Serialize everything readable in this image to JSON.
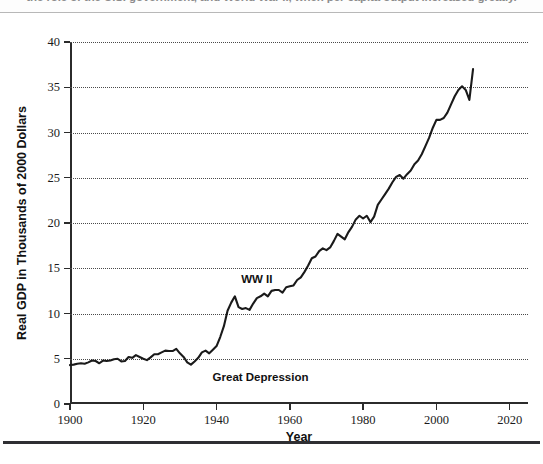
{
  "caption": {
    "text": "the role of the U.S. government, and World War II, when per capita output increased greatly."
  },
  "chart_data": {
    "type": "line",
    "title": "",
    "xlabel": "Year",
    "ylabel": "Real GDP in Thousands of 2000 Dollars",
    "xlim": [
      1900,
      2025
    ],
    "ylim": [
      0,
      40
    ],
    "xticks": [
      1900,
      1920,
      1940,
      1960,
      1980,
      2000,
      2020
    ],
    "yticks": [
      0,
      5,
      10,
      15,
      20,
      25,
      30,
      35,
      40
    ],
    "grid": true,
    "legend": "none",
    "line_color": "#1a1a1a",
    "series": [
      {
        "name": "Real GDP per capita",
        "x": [
          1900,
          1901,
          1902,
          1903,
          1904,
          1905,
          1906,
          1907,
          1908,
          1909,
          1910,
          1911,
          1912,
          1913,
          1914,
          1915,
          1916,
          1917,
          1918,
          1919,
          1920,
          1921,
          1922,
          1923,
          1924,
          1925,
          1926,
          1927,
          1928,
          1929,
          1930,
          1931,
          1932,
          1933,
          1934,
          1935,
          1936,
          1937,
          1938,
          1939,
          1940,
          1941,
          1942,
          1943,
          1944,
          1945,
          1946,
          1947,
          1948,
          1949,
          1950,
          1951,
          1952,
          1953,
          1954,
          1955,
          1956,
          1957,
          1958,
          1959,
          1960,
          1961,
          1962,
          1963,
          1964,
          1965,
          1966,
          1967,
          1968,
          1969,
          1970,
          1971,
          1972,
          1973,
          1974,
          1975,
          1976,
          1977,
          1978,
          1979,
          1980,
          1981,
          1982,
          1983,
          1984,
          1985,
          1986,
          1987,
          1988,
          1989,
          1990,
          1991,
          1992,
          1993,
          1994,
          1995,
          1996,
          1997,
          1998,
          1999,
          2000,
          2001,
          2002,
          2003,
          2004,
          2005,
          2006,
          2007,
          2008,
          2009,
          2010
        ],
        "values": [
          4.3,
          4.35,
          4.45,
          4.5,
          4.45,
          4.6,
          4.8,
          4.75,
          4.5,
          4.8,
          4.75,
          4.8,
          4.95,
          5.0,
          4.7,
          4.75,
          5.2,
          5.1,
          5.4,
          5.2,
          5.0,
          4.85,
          5.15,
          5.5,
          5.5,
          5.7,
          5.9,
          5.85,
          5.85,
          6.1,
          5.6,
          5.2,
          4.6,
          4.35,
          4.7,
          5.1,
          5.7,
          5.9,
          5.6,
          6.0,
          6.4,
          7.4,
          8.6,
          10.3,
          11.2,
          11.9,
          10.7,
          10.5,
          10.6,
          10.4,
          11.1,
          11.7,
          11.9,
          12.2,
          11.9,
          12.5,
          12.6,
          12.6,
          12.3,
          12.9,
          13.0,
          13.1,
          13.7,
          14.0,
          14.6,
          15.3,
          16.1,
          16.3,
          16.9,
          17.2,
          17.0,
          17.3,
          18.0,
          18.8,
          18.5,
          18.2,
          19.0,
          19.6,
          20.4,
          20.8,
          20.5,
          20.8,
          20.1,
          20.7,
          22.0,
          22.6,
          23.2,
          23.8,
          24.5,
          25.1,
          25.3,
          24.9,
          25.4,
          25.8,
          26.5,
          26.9,
          27.6,
          28.5,
          29.4,
          30.5,
          31.4,
          31.4,
          31.6,
          32.2,
          33.1,
          34.0,
          34.7,
          35.1,
          34.7,
          33.6,
          37.0
        ]
      }
    ],
    "annotations": [
      {
        "text": "WW II",
        "x": 1951,
        "y": 13.8
      },
      {
        "text": "Great Depression",
        "x": 1952,
        "y": 3.0
      }
    ]
  }
}
